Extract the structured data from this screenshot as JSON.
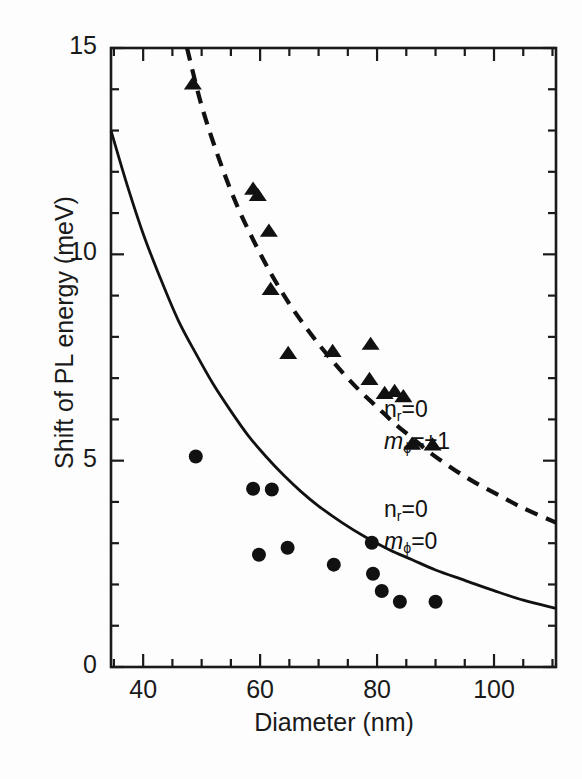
{
  "figure": {
    "background": "#fdfdfd",
    "ink": "#1a1a1a"
  },
  "axes": {
    "x_title": "Diameter (nm)",
    "y_title": "Shift of PL energy (meV)",
    "x_ticks": [
      "40",
      "60",
      "80",
      "100"
    ],
    "y_ticks": [
      "15",
      "10",
      "5",
      "0"
    ]
  },
  "legend": {
    "upper": {
      "line1_pre": "n",
      "line1_sub": "r",
      "line1_post": "=0",
      "line2_pre": "m",
      "line2_sub": "ϕ",
      "line2_post": "=±1"
    },
    "lower": {
      "line1_pre": "n",
      "line1_sub": "r",
      "line1_post": "=0",
      "line2_pre": "m",
      "line2_sub": "ϕ",
      "line2_post": "=0"
    }
  },
  "chart_data": {
    "type": "scatter",
    "title": "",
    "xlabel": "Diameter (nm)",
    "ylabel": "Shift of PL energy (meV)",
    "xlim": [
      34.5,
      110.6
    ],
    "ylim": [
      0,
      15
    ],
    "xticks": [
      40,
      60,
      80,
      100
    ],
    "yticks": [
      0,
      5,
      10,
      15
    ],
    "xminor_step": 5,
    "yminor_step": 1,
    "grid": false,
    "legend_position": "inside-right",
    "series": [
      {
        "name": "m_phi=0 (circles)",
        "marker": "filled-circle",
        "color": "#111111",
        "points": [
          [
            49.0,
            5.1
          ],
          [
            58.8,
            4.32
          ],
          [
            62.0,
            4.3
          ],
          [
            59.8,
            2.72
          ],
          [
            64.7,
            2.89
          ],
          [
            72.6,
            2.48
          ],
          [
            79.1,
            3.01
          ],
          [
            79.3,
            2.26
          ],
          [
            80.8,
            1.84
          ],
          [
            83.9,
            1.58
          ],
          [
            90.0,
            1.58
          ]
        ]
      },
      {
        "name": "m_phi=±1 (triangles)",
        "marker": "filled-triangle",
        "color": "#111111",
        "points": [
          [
            48.5,
            14.13
          ],
          [
            58.8,
            11.58
          ],
          [
            59.6,
            11.43
          ],
          [
            61.5,
            10.56
          ],
          [
            61.8,
            9.15
          ],
          [
            64.8,
            7.6
          ],
          [
            72.4,
            7.65
          ],
          [
            78.9,
            7.82
          ],
          [
            78.7,
            6.97
          ],
          [
            81.3,
            6.63
          ],
          [
            83.0,
            6.68
          ],
          [
            84.5,
            6.55
          ],
          [
            86.0,
            5.4
          ],
          [
            89.5,
            5.38
          ]
        ]
      }
    ],
    "curves": [
      {
        "name": "theory m_phi=0",
        "style": "solid",
        "color": "#111111",
        "points": [
          [
            34.5,
            13.0
          ],
          [
            37,
            11.8
          ],
          [
            40,
            10.5
          ],
          [
            43,
            9.4
          ],
          [
            46,
            8.4
          ],
          [
            49,
            7.6
          ],
          [
            52,
            6.85
          ],
          [
            55,
            6.2
          ],
          [
            58,
            5.6
          ],
          [
            61,
            5.1
          ],
          [
            64,
            4.65
          ],
          [
            67,
            4.25
          ],
          [
            70,
            3.9
          ],
          [
            74,
            3.5
          ],
          [
            78,
            3.15
          ],
          [
            82,
            2.85
          ],
          [
            86,
            2.6
          ],
          [
            90,
            2.35
          ],
          [
            95,
            2.1
          ],
          [
            100,
            1.85
          ],
          [
            105,
            1.62
          ],
          [
            110.6,
            1.42
          ]
        ]
      },
      {
        "name": "theory m_phi=±1",
        "style": "dashed",
        "color": "#111111",
        "points": [
          [
            47.5,
            15.0
          ],
          [
            50,
            13.6
          ],
          [
            53,
            12.3
          ],
          [
            56,
            11.2
          ],
          [
            59,
            10.3
          ],
          [
            62,
            9.5
          ],
          [
            65,
            8.8
          ],
          [
            68,
            8.2
          ],
          [
            71,
            7.65
          ],
          [
            74,
            7.15
          ],
          [
            77,
            6.7
          ],
          [
            80,
            6.3
          ],
          [
            83,
            5.9
          ],
          [
            86,
            5.55
          ],
          [
            89,
            5.2
          ],
          [
            93,
            4.8
          ],
          [
            97,
            4.45
          ],
          [
            101,
            4.15
          ],
          [
            105,
            3.85
          ],
          [
            110.6,
            3.5
          ]
        ]
      }
    ]
  }
}
